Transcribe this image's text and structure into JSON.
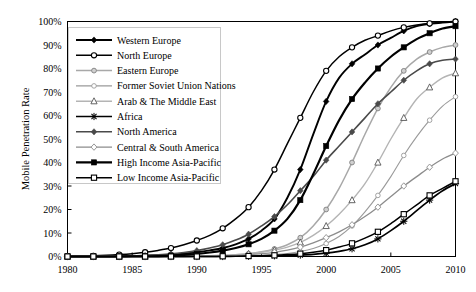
{
  "chart_data": {
    "type": "line",
    "title": "",
    "xlabel": "",
    "ylabel": "Mobile Penetration Rate",
    "xlim": [
      1980,
      2010
    ],
    "ylim": [
      0,
      100
    ],
    "grid": false,
    "legend_position": "upper-left",
    "x_ticks": [
      "1980",
      "1985",
      "1990",
      "1995",
      "2000",
      "2005",
      "2010"
    ],
    "x_tick_values": [
      1980,
      1985,
      1990,
      1995,
      2000,
      2005,
      2010
    ],
    "y_ticks": [
      "0%",
      "10%",
      "20%",
      "30%",
      "40%",
      "50%",
      "60%",
      "70%",
      "80%",
      "90%",
      "100%"
    ],
    "y_tick_values": [
      0,
      10,
      20,
      30,
      40,
      50,
      60,
      70,
      80,
      90,
      100
    ],
    "x": [
      1980,
      1981,
      1982,
      1983,
      1984,
      1985,
      1986,
      1987,
      1988,
      1989,
      1990,
      1991,
      1992,
      1993,
      1994,
      1995,
      1996,
      1997,
      1998,
      1999,
      2000,
      2001,
      2002,
      2003,
      2004,
      2005,
      2006,
      2007,
      2008,
      2009,
      2010
    ],
    "series": [
      {
        "name": "Western Europe",
        "color": "#000000",
        "marker": "diamond-filled",
        "width": 1.9,
        "values": [
          0,
          0,
          0,
          0,
          0.1,
          0.2,
          0.3,
          0.5,
          0.8,
          1.2,
          1.8,
          2.6,
          3.6,
          5.2,
          7.5,
          11,
          16,
          25,
          37,
          52,
          66,
          76,
          82,
          86,
          90,
          93,
          96,
          98,
          99,
          99.6,
          100
        ]
      },
      {
        "name": "North Europe",
        "color": "#000000",
        "marker": "circle-open",
        "width": 1.5,
        "values": [
          0.1,
          0.2,
          0.3,
          0.5,
          0.8,
          1.2,
          1.8,
          2.6,
          3.6,
          5.0,
          6.8,
          9.0,
          12,
          16,
          21,
          28,
          37,
          48,
          59,
          70,
          79,
          85,
          89,
          92,
          94,
          96,
          97.5,
          98.5,
          99.2,
          99.7,
          100
        ]
      },
      {
        "name": "Eastern Europe",
        "color": "#a8a8a8",
        "marker": "circle-gray",
        "width": 1.5,
        "values": [
          0,
          0,
          0,
          0,
          0,
          0,
          0,
          0,
          0,
          0,
          0.1,
          0.2,
          0.4,
          0.7,
          1.2,
          2,
          3.2,
          5,
          8,
          13,
          20,
          29,
          40,
          52,
          63,
          72,
          79,
          84,
          87,
          89,
          90
        ]
      },
      {
        "name": "Former Soviet Union Nations",
        "color": "#9a9a9a",
        "marker": "circle-open-light",
        "width": 1.1,
        "values": [
          0,
          0,
          0,
          0,
          0,
          0,
          0,
          0,
          0,
          0,
          0,
          0,
          0.1,
          0.2,
          0.3,
          0.5,
          0.8,
          1.3,
          2.1,
          3.4,
          5.5,
          8.5,
          13,
          19,
          26,
          34,
          43,
          51,
          58,
          64,
          68
        ]
      },
      {
        "name": "Arab & The Middle East",
        "color": "#b4b4b4",
        "marker": "triangle-open",
        "width": 1.4,
        "values": [
          0,
          0,
          0,
          0,
          0,
          0,
          0,
          0,
          0.1,
          0.1,
          0.2,
          0.3,
          0.5,
          0.8,
          1.2,
          1.8,
          2.7,
          4,
          6,
          9,
          13,
          18,
          24,
          31,
          40,
          50,
          59,
          67,
          72,
          76,
          78
        ]
      },
      {
        "name": "Africa",
        "color": "#000000",
        "marker": "asterisk",
        "width": 1.7,
        "values": [
          0,
          0,
          0,
          0,
          0,
          0,
          0,
          0,
          0,
          0,
          0,
          0,
          0,
          0.1,
          0.1,
          0.2,
          0.3,
          0.4,
          0.6,
          0.9,
          1.4,
          2.2,
          3.3,
          5,
          7.5,
          11,
          15,
          19.5,
          24,
          28,
          31
        ]
      },
      {
        "name": "North America",
        "color": "#4a4a4a",
        "marker": "diamond-dark",
        "width": 1.6,
        "values": [
          0,
          0,
          0,
          0,
          0.1,
          0.2,
          0.4,
          0.7,
          1.1,
          1.7,
          2.5,
          3.6,
          5,
          7,
          9.5,
          13,
          17,
          22,
          28,
          34,
          41,
          47,
          53,
          59,
          65,
          70,
          75,
          79,
          82,
          83.5,
          84
        ]
      },
      {
        "name": "Central & South America",
        "color": "#8c8c8c",
        "marker": "diamond-open",
        "width": 1.3,
        "values": [
          0,
          0,
          0,
          0,
          0,
          0,
          0,
          0,
          0,
          0,
          0.1,
          0.2,
          0.3,
          0.5,
          0.8,
          1.2,
          1.8,
          2.7,
          4,
          5.8,
          8,
          10.5,
          13.5,
          17,
          21,
          25.5,
          30,
          34,
          38,
          41.5,
          44
        ]
      },
      {
        "name": "High Income Asia-Pacific",
        "color": "#000000",
        "marker": "square-filled",
        "width": 2.2,
        "values": [
          0,
          0,
          0,
          0,
          0,
          0.1,
          0.1,
          0.2,
          0.4,
          0.7,
          1.1,
          1.7,
          2.5,
          3.6,
          5.2,
          7.5,
          11,
          16,
          24,
          35,
          47,
          58,
          67,
          74,
          80,
          85,
          89,
          92.5,
          95,
          97,
          98
        ]
      },
      {
        "name": "Low Income Asia-Pacific",
        "color": "#000000",
        "marker": "square-open",
        "width": 1.5,
        "values": [
          0,
          0,
          0,
          0,
          0,
          0,
          0,
          0,
          0,
          0,
          0,
          0,
          0.1,
          0.1,
          0.2,
          0.3,
          0.5,
          0.8,
          1.2,
          1.8,
          2.7,
          4,
          5.6,
          7.8,
          10.5,
          14,
          18,
          22,
          26,
          29,
          32
        ]
      }
    ]
  }
}
